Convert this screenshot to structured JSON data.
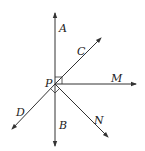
{
  "diagram": {
    "type": "geometry-rays",
    "point": {
      "name": "P",
      "x": 55,
      "y": 84
    },
    "labels": {
      "A": "A",
      "B": "B",
      "C": "C",
      "D": "D",
      "M": "M",
      "N": "N",
      "P": "P"
    },
    "rays": [
      {
        "name": "PA",
        "to": [
          55,
          13
        ]
      },
      {
        "name": "PB",
        "to": [
          55,
          146
        ]
      },
      {
        "name": "PC",
        "to": [
          101,
          38
        ]
      },
      {
        "name": "PD",
        "to": [
          12,
          129
        ]
      },
      {
        "name": "PM",
        "to": [
          136,
          84
        ]
      },
      {
        "name": "PN",
        "to": [
          108,
          137
        ]
      }
    ],
    "right_angles": [
      "APC",
      "DPN"
    ],
    "stroke_color": "#333333"
  }
}
